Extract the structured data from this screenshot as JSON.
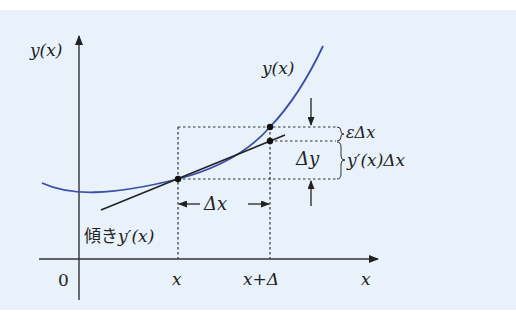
{
  "diagram": {
    "labels": {
      "y_axis": "y(x)",
      "x_axis": "x",
      "origin": "0",
      "curve": "y(x)",
      "x_tick": "x",
      "x_plus_delta_tick": "x+Δ",
      "delta_x": "Δx",
      "delta_y": "Δy",
      "epsilon_delta_x": "εΔx",
      "derivative_delta_x": "y′(x)Δx",
      "slope_prefix": "傾き",
      "slope_expr": "y′(x)"
    },
    "colors": {
      "background": "#e9f2fa",
      "curve": "#3a4fa8",
      "ink": "#222222"
    }
  }
}
